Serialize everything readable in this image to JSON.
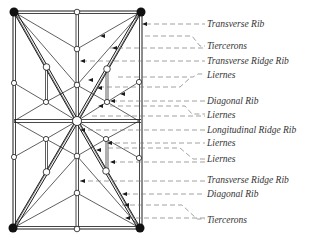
{
  "diagram": {
    "colors": {
      "ink": "#1a1a1a",
      "leader": "#7a7a7a",
      "label": "#333333",
      "background": "#ffffff"
    },
    "labels": [
      {
        "id": "transverse-rib",
        "text": "Transverse Rib",
        "y": 20
      },
      {
        "id": "tiercerons-top",
        "text": "Tiercerons",
        "y": 43
      },
      {
        "id": "transverse-ridge-rib-top",
        "text": "Transverse Ridge Rib",
        "y": 59
      },
      {
        "id": "liernes-1",
        "text": "Liernes",
        "y": 74
      },
      {
        "id": "diagonal-rib-top",
        "text": "Diagonal Rib",
        "y": 99
      },
      {
        "id": "liernes-2",
        "text": "Liernes",
        "y": 113
      },
      {
        "id": "longitudinal-ridge-rib",
        "text": "Longitudinal Ridge Rib",
        "y": 128
      },
      {
        "id": "liernes-3",
        "text": "Liernes",
        "y": 141
      },
      {
        "id": "liernes-4",
        "text": "Liernes",
        "y": 157
      },
      {
        "id": "transverse-ridge-rib-bottom",
        "text": "Transverse Ridge Rib",
        "y": 177
      },
      {
        "id": "diagonal-rib-bottom",
        "text": "Diagonal Rib",
        "y": 192
      },
      {
        "id": "tiercerons-bottom",
        "text": "Tiercerons",
        "y": 219
      }
    ]
  }
}
